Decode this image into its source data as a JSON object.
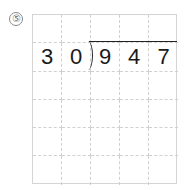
{
  "problem": {
    "number_label": "⑤",
    "divisor": [
      "3",
      "0"
    ],
    "dividend": [
      "9",
      "4",
      "7"
    ]
  },
  "grid": {
    "columns": 5,
    "rows": 6,
    "cells": [
      [
        "",
        "",
        "",
        "",
        ""
      ],
      [
        "3",
        "0",
        "9",
        "4",
        "7"
      ],
      [
        "",
        "",
        "",
        "",
        ""
      ],
      [
        "",
        "",
        "",
        "",
        ""
      ],
      [
        "",
        "",
        "",
        "",
        ""
      ],
      [
        "",
        "",
        "",
        "",
        ""
      ]
    ]
  }
}
